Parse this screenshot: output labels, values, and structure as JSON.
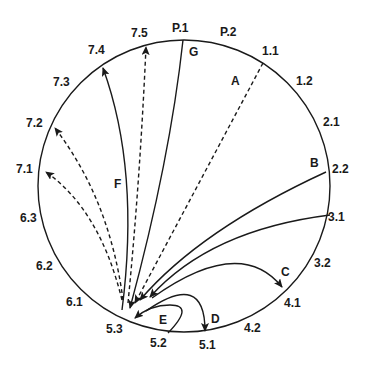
{
  "diagram": {
    "type": "circular-transition-diagram",
    "circle": {
      "cx": 184,
      "cy": 186,
      "r": 146
    },
    "stroke_color": "#1a1a1a",
    "perimeter_labels": [
      {
        "id": "P.1",
        "text": "P.1",
        "x": 172,
        "y": 22
      },
      {
        "id": "P.2",
        "text": "P.2",
        "x": 220,
        "y": 26
      },
      {
        "id": "1.1",
        "text": "1.1",
        "x": 262,
        "y": 45
      },
      {
        "id": "1.2",
        "text": "1.2",
        "x": 296,
        "y": 75
      },
      {
        "id": "2.1",
        "text": "2.1",
        "x": 323,
        "y": 116
      },
      {
        "id": "2.2",
        "text": "2.2",
        "x": 332,
        "y": 163
      },
      {
        "id": "3.1",
        "text": "3.1",
        "x": 328,
        "y": 211
      },
      {
        "id": "3.2",
        "text": "3.2",
        "x": 314,
        "y": 257
      },
      {
        "id": "4.1",
        "text": "4.1",
        "x": 284,
        "y": 297
      },
      {
        "id": "4.2",
        "text": "4.2",
        "x": 244,
        "y": 322
      },
      {
        "id": "5.1",
        "text": "5.1",
        "x": 199,
        "y": 339
      },
      {
        "id": "5.2",
        "text": "5.2",
        "x": 150,
        "y": 337
      },
      {
        "id": "5.3",
        "text": "5.3",
        "x": 106,
        "y": 323
      },
      {
        "id": "6.1",
        "text": "6.1",
        "x": 66,
        "y": 296
      },
      {
        "id": "6.2",
        "text": "6.2",
        "x": 36,
        "y": 260
      },
      {
        "id": "6.3",
        "text": "6.3",
        "x": 20,
        "y": 212
      },
      {
        "id": "7.1",
        "text": "7.1",
        "x": 16,
        "y": 163
      },
      {
        "id": "7.2",
        "text": "7.2",
        "x": 26,
        "y": 117
      },
      {
        "id": "7.3",
        "text": "7.3",
        "x": 53,
        "y": 76
      },
      {
        "id": "7.4",
        "text": "7.4",
        "x": 88,
        "y": 44
      },
      {
        "id": "7.5",
        "text": "7.5",
        "x": 131,
        "y": 27
      }
    ],
    "transition_labels": [
      {
        "id": "A",
        "text": "A",
        "x": 231,
        "y": 75
      },
      {
        "id": "B",
        "text": "B",
        "x": 310,
        "y": 157
      },
      {
        "id": "C",
        "text": "C",
        "x": 281,
        "y": 266
      },
      {
        "id": "D",
        "text": "D",
        "x": 211,
        "y": 313
      },
      {
        "id": "E",
        "text": "E",
        "x": 159,
        "y": 314
      },
      {
        "id": "F",
        "text": "F",
        "x": 114,
        "y": 178
      },
      {
        "id": "G",
        "text": "G",
        "x": 189,
        "y": 46
      }
    ],
    "arrows": [
      {
        "name": "arrow-G-solid",
        "from": "P.1",
        "to": "5.3",
        "style": "solid",
        "d": "M183,40 Q170,160 130,308"
      },
      {
        "name": "arrow-A-dashed",
        "from": "1.1",
        "to": "5.3",
        "style": "dashed",
        "d": "M263,63 L135,303"
      },
      {
        "name": "arrow-B-solid",
        "from": "2.2",
        "to": "5.3",
        "style": "solid",
        "d": "M326,172 Q200,230 140,300"
      },
      {
        "name": "arrow-lower-solid",
        "from": "3.1",
        "to": "5.3",
        "style": "solid",
        "d": "M330,215 Q210,230 150,297"
      },
      {
        "name": "arrow-C-solid",
        "from": "5.3",
        "to": "4.1",
        "style": "solid",
        "d": "M152,298 Q240,235 282,287"
      },
      {
        "name": "arrow-D-solid",
        "from": "5.3",
        "to": "5.1",
        "style": "solid",
        "d": "M146,311 Q205,270 205,331"
      },
      {
        "name": "arrow-E-solid",
        "from": "5.2",
        "to": "5.3",
        "style": "solid",
        "d": "M168,333 Q195,305 170,305 Q150,305 135,318"
      },
      {
        "name": "arrow-7.5-dashed",
        "from": "5.3",
        "to": "7.5",
        "style": "dashed",
        "d": "M128,303 Q140,180 146,47"
      },
      {
        "name": "arrow-7.4-solid",
        "from": "5.3",
        "to": "7.4",
        "style": "solid",
        "d": "M122,310 Q140,170 103,68"
      },
      {
        "name": "arrow-7.2-dashed",
        "from": "5.3",
        "to": "7.2",
        "style": "dashed",
        "d": "M123,300 Q110,200 55,128"
      },
      {
        "name": "arrow-7.1-dashed",
        "from": "5.3",
        "to": "7.1",
        "style": "dashed",
        "d": "M122,300 Q100,210 46,172"
      }
    ]
  }
}
